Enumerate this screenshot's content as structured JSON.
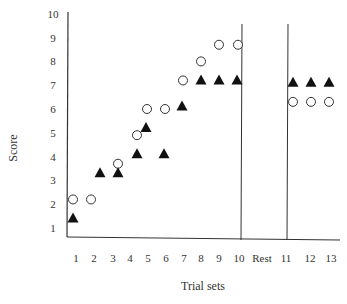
{
  "chart_data": {
    "type": "scatter",
    "title": "",
    "xlabel": "Trial sets",
    "ylabel": "Score",
    "categories": [
      "1",
      "2",
      "3",
      "4",
      "5",
      "6",
      "7",
      "8",
      "9",
      "10",
      "Rest",
      "11",
      "12",
      "13"
    ],
    "ylim": [
      1,
      10
    ],
    "yticks": [
      "1",
      "2",
      "3",
      "4",
      "5",
      "6",
      "7",
      "8",
      "9",
      "10"
    ],
    "grid": false,
    "legend": null,
    "dividers_after": [
      "10",
      "Rest"
    ],
    "series": [
      {
        "name": "open-circle",
        "marker": "circle-open",
        "x": [
          "1",
          "2",
          "3",
          "4",
          "5",
          "6",
          "7",
          "8",
          "9",
          "10",
          "11",
          "12",
          "13"
        ],
        "values": [
          2.2,
          2.2,
          3.7,
          4.9,
          6.0,
          6.0,
          7.2,
          8.0,
          8.7,
          8.7,
          6.3,
          6.3,
          6.3
        ]
      },
      {
        "name": "filled-triangle",
        "marker": "triangle-filled",
        "x": [
          "1",
          "2",
          "3",
          "4",
          "5",
          "6",
          "7",
          "8",
          "9",
          "10",
          "11",
          "12",
          "13"
        ],
        "values": [
          1.4,
          3.3,
          3.3,
          4.1,
          5.2,
          4.1,
          6.1,
          7.2,
          7.2,
          7.2,
          7.1,
          7.1,
          7.1
        ]
      }
    ]
  },
  "layout": {
    "x_label_positions": {
      "1": 76,
      "2": 94,
      "3": 113,
      "4": 130,
      "5": 148,
      "6": 166,
      "7": 184,
      "8": 201,
      "9": 219,
      "10": 239,
      "Rest": 262,
      "11": 286,
      "12": 310,
      "13": 331
    },
    "circle_x": [
      73,
      91,
      118,
      137,
      147,
      165,
      183,
      201,
      219,
      238,
      293,
      311,
      329
    ],
    "triangle_x": [
      73,
      100,
      118,
      137,
      146,
      164,
      182,
      201,
      219,
      237,
      293,
      311,
      329
    ]
  }
}
